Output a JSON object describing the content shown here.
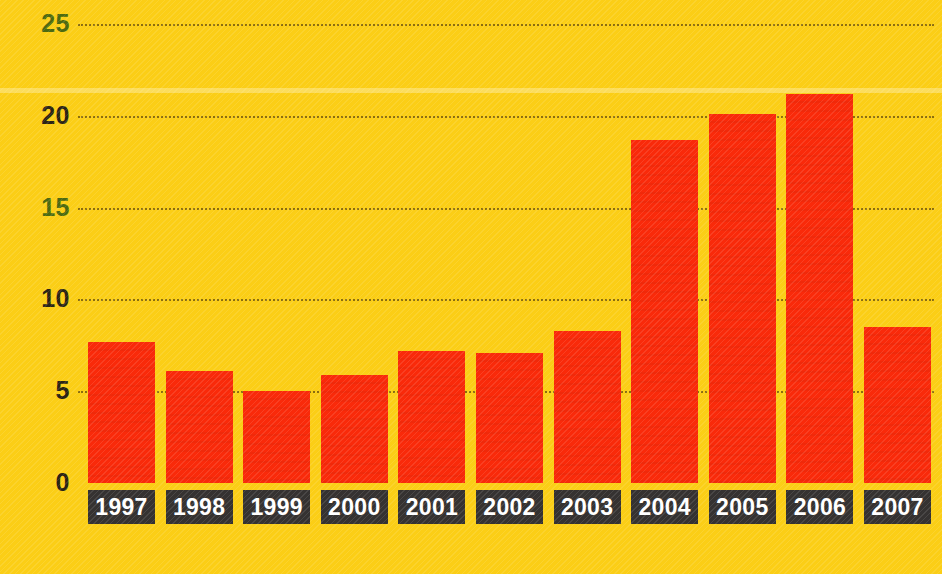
{
  "chart_data": {
    "type": "bar",
    "title": "",
    "subtitle": "",
    "xlabel": "",
    "ylabel": "",
    "categories": [
      "1997",
      "1998",
      "1999",
      "2000",
      "2001",
      "2002",
      "2003",
      "2004",
      "2005",
      "2006",
      "2007"
    ],
    "values": [
      7.7,
      6.1,
      5.0,
      5.9,
      7.2,
      7.1,
      8.3,
      18.7,
      20.1,
      21.2,
      8.5
    ],
    "series": [
      {
        "name": "",
        "values": [
          7.7,
          6.1,
          5.0,
          5.9,
          7.2,
          7.1,
          8.3,
          18.7,
          20.1,
          21.2,
          8.5
        ]
      }
    ],
    "ylim": [
      0,
      25
    ],
    "yticks": [
      0,
      5,
      10,
      15,
      20,
      25
    ],
    "ytick_labels": [
      "0",
      "5",
      "10",
      "15",
      "20",
      "25"
    ],
    "grid": true,
    "grid_axis": "y",
    "grid_style": "dotted",
    "legend": false,
    "legend_position": "none",
    "annotations": [],
    "colors": {
      "background": "#fbce16",
      "bar": "#f92a0a",
      "gridline": "#46320a",
      "ytick_text": "#2b2414",
      "ytick_text_tinted": "#4d6a10",
      "xtick_box": "#353231",
      "xtick_text": "#ffffff"
    }
  },
  "axis": {
    "y": {
      "ticks": [
        {
          "label": "25",
          "value": 25,
          "tint": true
        },
        {
          "label": "20",
          "value": 20,
          "tint": false
        },
        {
          "label": "15",
          "value": 15,
          "tint": true
        },
        {
          "label": "10",
          "value": 10,
          "tint": false
        },
        {
          "label": "5",
          "value": 5,
          "tint": false
        },
        {
          "label": "0",
          "value": 0,
          "tint": false
        }
      ]
    },
    "x": {
      "ticks": [
        {
          "label": "1997"
        },
        {
          "label": "1998"
        },
        {
          "label": "1999"
        },
        {
          "label": "2000"
        },
        {
          "label": "2001"
        },
        {
          "label": "2002"
        },
        {
          "label": "2003"
        },
        {
          "label": "2004"
        },
        {
          "label": "2005"
        },
        {
          "label": "2006"
        },
        {
          "label": "2007"
        }
      ]
    }
  }
}
